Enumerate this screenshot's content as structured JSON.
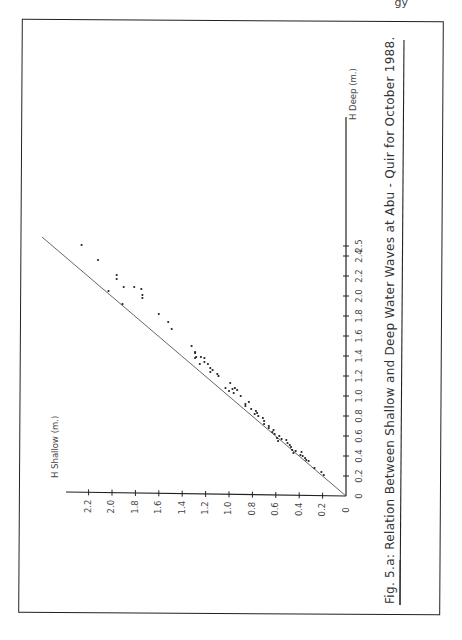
{
  "page": {
    "header_fragment": "gy"
  },
  "figure": {
    "caption": "Fig. 5.a: Relation   Between   Shallow   and   Deep   Water   Waves   at   Abu - Quir   for   October   1988.",
    "caption_parts": {
      "label": "Fig. 5.a:",
      "text": "Relation   Between   Shallow   and   Deep   Water   Waves   at   Abu - Quir   for   October   1988."
    },
    "orientation": "rotated 90° counter-clockwise"
  },
  "chart_data": {
    "type": "scatter",
    "title": "Relation Between Shallow and Deep Water Waves at Abu - Quir for October 1988.",
    "xlabel": "H Deep (m.)",
    "ylabel": "H Shallow (m.)",
    "xlim": [
      0,
      2.5
    ],
    "ylim": [
      0,
      2.3
    ],
    "x_ticks": [
      "0",
      "0.2",
      "0.4",
      "0.6",
      "0.8",
      "1.0",
      "1.2",
      "1.4",
      "1.6",
      "1.8",
      "2.0",
      "2.2",
      "2.4",
      "2.5"
    ],
    "y_ticks": [
      "0",
      "0.2",
      "0.4",
      "0.6",
      "0.8",
      "1.0",
      "1.2",
      "1.4",
      "1.6",
      "1.8",
      "2.0",
      "2.2"
    ],
    "grid": false,
    "legend": null,
    "fit_line": {
      "type": "linear",
      "from": [
        0,
        0
      ],
      "to": [
        2.6,
        2.55
      ],
      "slope": 0.98
    },
    "points": [
      {
        "x": 2.51,
        "y": 2.26
      },
      {
        "x": 2.36,
        "y": 2.12
      },
      {
        "x": 2.21,
        "y": 1.96
      },
      {
        "x": 2.17,
        "y": 1.96
      },
      {
        "x": 2.09,
        "y": 1.9
      },
      {
        "x": 2.05,
        "y": 2.03
      },
      {
        "x": 1.92,
        "y": 1.91
      },
      {
        "x": 2.09,
        "y": 1.81
      },
      {
        "x": 2.07,
        "y": 1.75
      },
      {
        "x": 2.01,
        "y": 1.74
      },
      {
        "x": 1.98,
        "y": 1.74
      },
      {
        "x": 1.82,
        "y": 1.6
      },
      {
        "x": 1.74,
        "y": 1.52
      },
      {
        "x": 1.67,
        "y": 1.49
      },
      {
        "x": 1.5,
        "y": 1.32
      },
      {
        "x": 1.44,
        "y": 1.29
      },
      {
        "x": 1.43,
        "y": 1.29
      },
      {
        "x": 1.39,
        "y": 1.28
      },
      {
        "x": 1.38,
        "y": 1.29
      },
      {
        "x": 1.39,
        "y": 1.24
      },
      {
        "x": 1.38,
        "y": 1.21
      },
      {
        "x": 1.34,
        "y": 1.21
      },
      {
        "x": 1.32,
        "y": 1.25
      },
      {
        "x": 1.32,
        "y": 1.18
      },
      {
        "x": 1.28,
        "y": 1.16
      },
      {
        "x": 1.26,
        "y": 1.14
      },
      {
        "x": 1.24,
        "y": 1.16
      },
      {
        "x": 1.22,
        "y": 1.1
      },
      {
        "x": 1.2,
        "y": 1.09
      },
      {
        "x": 1.13,
        "y": 0.99
      },
      {
        "x": 1.08,
        "y": 1.03
      },
      {
        "x": 1.08,
        "y": 0.95
      },
      {
        "x": 1.07,
        "y": 0.97
      },
      {
        "x": 1.06,
        "y": 0.93
      },
      {
        "x": 1.05,
        "y": 1.0
      },
      {
        "x": 1.03,
        "y": 0.96
      },
      {
        "x": 1.0,
        "y": 0.9
      },
      {
        "x": 0.94,
        "y": 0.83
      },
      {
        "x": 0.92,
        "y": 0.86
      },
      {
        "x": 0.9,
        "y": 0.86
      },
      {
        "x": 0.87,
        "y": 0.81
      },
      {
        "x": 0.85,
        "y": 0.77
      },
      {
        "x": 0.83,
        "y": 0.76
      },
      {
        "x": 0.82,
        "y": 0.78
      },
      {
        "x": 0.8,
        "y": 0.75
      },
      {
        "x": 0.78,
        "y": 0.71
      },
      {
        "x": 0.75,
        "y": 0.7
      },
      {
        "x": 0.72,
        "y": 0.7
      },
      {
        "x": 0.7,
        "y": 0.66
      },
      {
        "x": 0.68,
        "y": 0.66
      },
      {
        "x": 0.66,
        "y": 0.62
      },
      {
        "x": 0.64,
        "y": 0.63
      },
      {
        "x": 0.62,
        "y": 0.61
      },
      {
        "x": 0.6,
        "y": 0.57
      },
      {
        "x": 0.58,
        "y": 0.59
      },
      {
        "x": 0.57,
        "y": 0.55
      },
      {
        "x": 0.56,
        "y": 0.51
      },
      {
        "x": 0.55,
        "y": 0.58
      },
      {
        "x": 0.53,
        "y": 0.5
      },
      {
        "x": 0.51,
        "y": 0.48
      },
      {
        "x": 0.49,
        "y": 0.47
      },
      {
        "x": 0.46,
        "y": 0.46
      },
      {
        "x": 0.45,
        "y": 0.43
      },
      {
        "x": 0.44,
        "y": 0.38
      },
      {
        "x": 0.43,
        "y": 0.45
      },
      {
        "x": 0.41,
        "y": 0.39
      },
      {
        "x": 0.4,
        "y": 0.37
      },
      {
        "x": 0.38,
        "y": 0.35
      },
      {
        "x": 0.36,
        "y": 0.34
      },
      {
        "x": 0.35,
        "y": 0.32
      },
      {
        "x": 0.28,
        "y": 0.27
      },
      {
        "x": 0.24,
        "y": 0.21
      },
      {
        "x": 0.21,
        "y": 0.19
      }
    ]
  },
  "layout": {
    "origin_px": [
      346,
      496
    ],
    "deep_px_per_unit": 100,
    "shallow_px_per_unit": 117
  }
}
